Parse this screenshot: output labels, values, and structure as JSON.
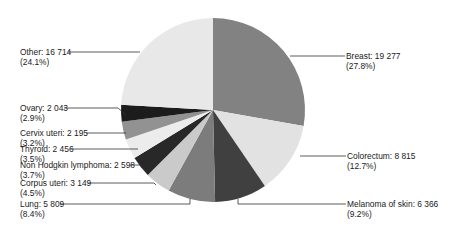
{
  "chart_data": {
    "type": "pie",
    "title": "",
    "start_angle_deg": 0,
    "direction": "clockwise",
    "slices": [
      {
        "label": "Breast",
        "value": 19277,
        "percent": "27.8%",
        "color": "#828282"
      },
      {
        "label": "Colorectum",
        "value": 8815,
        "percent": "12.7%",
        "color": "#e2e2e2"
      },
      {
        "label": "Melanoma of skin",
        "value": 6366,
        "percent": "9.2%",
        "color": "#404040"
      },
      {
        "label": "Lung",
        "value": 5809,
        "percent": "8.4%",
        "color": "#7c7c7c"
      },
      {
        "label": "Corpus uteri",
        "value": 3149,
        "percent": "4.5%",
        "color": "#cacaca"
      },
      {
        "label": "Non Hodgkin lymphoma",
        "value": 2598,
        "percent": "3.7%",
        "color": "#282828"
      },
      {
        "label": "Thyroid",
        "value": 2456,
        "percent": "3.5%",
        "color": "#ececec"
      },
      {
        "label": "Cervix uteri",
        "value": 2195,
        "percent": "3.2%",
        "color": "#929292"
      },
      {
        "label": "Ovary",
        "value": 2043,
        "percent": "2.9%",
        "color": "#1c1c1c"
      },
      {
        "label": "Other",
        "value": 16714,
        "percent": "24.1%",
        "color": "#e8e8e8"
      }
    ],
    "labels": [
      {
        "line1": "Breast: 19 277",
        "line2": "(27.8%)"
      },
      {
        "line1": "Colorectum: 8 815",
        "line2": "(12.7%)"
      },
      {
        "line1": "Melanoma of skin: 6 366",
        "line2": "(9.2%)"
      },
      {
        "line1": "Lung: 5 809",
        "line2": "(8.4%)"
      },
      {
        "line1": "Corpus uteri: 3 149",
        "line2": "(4.5%)"
      },
      {
        "line1": "Non Hodgkin lymphoma: 2 598",
        "line2": "(3.7%)"
      },
      {
        "line1": "Thyroid: 2 456",
        "line2": "(3.5%)"
      },
      {
        "line1": "Cervix uteri: 2 195",
        "line2": "(3.2%)"
      },
      {
        "line1": "Ovary: 2 043",
        "line2": "(2.9%)"
      },
      {
        "line1": "Other: 16 714",
        "line2": "(24.1%)"
      }
    ],
    "legend": "none (leader-line labels)"
  }
}
